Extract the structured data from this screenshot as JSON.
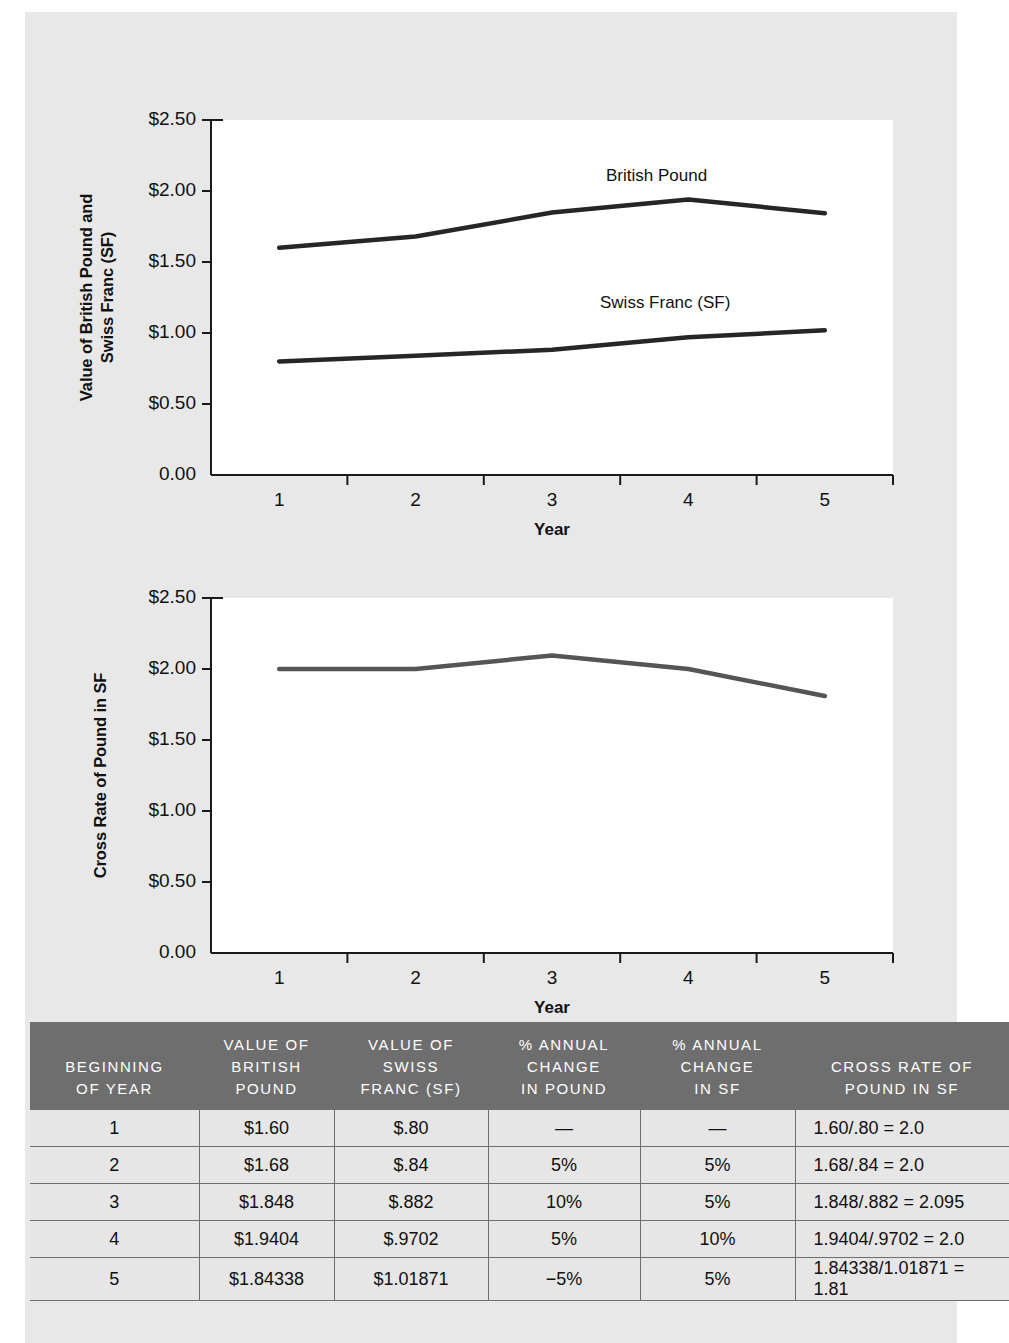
{
  "chart_data": [
    {
      "type": "line",
      "title": "",
      "xlabel": "Year",
      "ylabel": "Value of British Pound and Swiss Franc (SF)",
      "categories": [
        "1",
        "2",
        "3",
        "4",
        "5"
      ],
      "ytick_labels": [
        "$2.50",
        "$2.00",
        "$1.50",
        "$1.00",
        "$0.50",
        "0.00"
      ],
      "ytick_values": [
        2.5,
        2.0,
        1.5,
        1.0,
        0.5,
        0.0
      ],
      "ylim": [
        0.0,
        2.5
      ],
      "grid": false,
      "legend_position": "inline-annotation",
      "series": [
        {
          "name": "British Pound",
          "values": [
            1.6,
            1.68,
            1.848,
            1.9404,
            1.84338
          ]
        },
        {
          "name": "Swiss Franc (SF)",
          "values": [
            0.8,
            0.84,
            0.882,
            0.9702,
            1.01871
          ]
        }
      ]
    },
    {
      "type": "line",
      "title": "",
      "xlabel": "Year",
      "ylabel": "Cross Rate of Pound in SF",
      "categories": [
        "1",
        "2",
        "3",
        "4",
        "5"
      ],
      "ytick_labels": [
        "$2.50",
        "$2.00",
        "$1.50",
        "$1.00",
        "$0.50",
        "0.00"
      ],
      "ytick_values": [
        2.5,
        2.0,
        1.5,
        1.0,
        0.5,
        0.0
      ],
      "ylim": [
        0.0,
        2.5
      ],
      "grid": false,
      "legend_position": "none",
      "series": [
        {
          "name": "Cross Rate of Pound in SF",
          "values": [
            2.0,
            2.0,
            2.095,
            2.0,
            1.81
          ]
        }
      ]
    }
  ],
  "chart1": {
    "ylabel_line1": "Value of British Pound and",
    "ylabel_line2": "Swiss Franc (SF)",
    "xlabel": "Year",
    "ytick_labels": [
      "$2.50",
      "$2.00",
      "$1.50",
      "$1.00",
      "$0.50",
      "0.00"
    ],
    "xtick_labels": [
      "1",
      "2",
      "3",
      "4",
      "5"
    ],
    "series_label_pound": "British Pound",
    "series_label_franc": "Swiss Franc (SF)"
  },
  "chart2": {
    "ylabel_line1": "Cross Rate of Pound in SF",
    "xlabel": "Year",
    "ytick_labels": [
      "$2.50",
      "$2.00",
      "$1.50",
      "$1.00",
      "$0.50",
      "0.00"
    ],
    "xtick_labels": [
      "1",
      "2",
      "3",
      "4",
      "5"
    ]
  },
  "table": {
    "headers": [
      "BEGINNING\nOF YEAR",
      "VALUE OF\nBRITISH\nPOUND",
      "VALUE OF\nSWISS\nFRANC (SF)",
      "% ANNUAL\nCHANGE\nIN POUND",
      "% ANNUAL\nCHANGE\nIN SF",
      "CROSS RATE OF\nPOUND IN SF"
    ],
    "header_lines": [
      [
        "BEGINNING",
        "OF YEAR"
      ],
      [
        "VALUE OF",
        "BRITISH",
        "POUND"
      ],
      [
        "VALUE OF",
        "SWISS",
        "FRANC (SF)"
      ],
      [
        "% ANNUAL",
        "CHANGE",
        "IN POUND"
      ],
      [
        "% ANNUAL",
        "CHANGE",
        "IN SF"
      ],
      [
        "CROSS RATE OF",
        "POUND IN SF"
      ]
    ],
    "rows": [
      [
        "1",
        "$1.60",
        "$.80",
        "—",
        "—",
        "1.60/.80 = 2.0"
      ],
      [
        "2",
        "$1.68",
        "$.84",
        "5%",
        "5%",
        "1.68/.84 = 2.0"
      ],
      [
        "3",
        "$1.848",
        "$.882",
        "10%",
        "5%",
        "1.848/.882 = 2.095"
      ],
      [
        "4",
        "$1.9404",
        "$.9702",
        "5%",
        "10%",
        "1.9404/.9702 = 2.0"
      ],
      [
        "5",
        "$1.84338",
        "$1.01871",
        "−5%",
        "5%",
        "1.84338/1.01871 = 1.81"
      ]
    ]
  },
  "colors": {
    "page_background": "#ffffff",
    "paper_background": "#e8e8e8",
    "plot_background": "#ffffff",
    "line_color": "#262626",
    "cross_line_color": "#555555",
    "table_header_bg": "#6e6e6e",
    "table_header_text": "#ffffff",
    "table_cell_bg": "#e6e6e6",
    "table_rule": "#6e6e6e",
    "text": "#111111"
  }
}
